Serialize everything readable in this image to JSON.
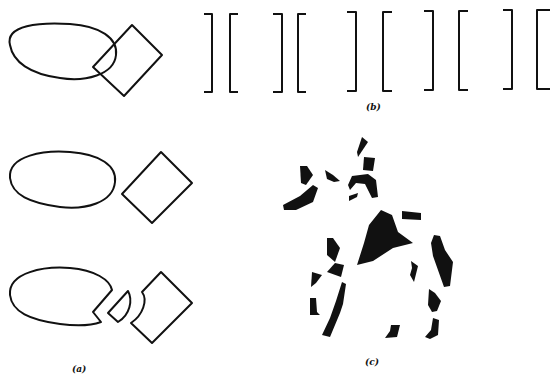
{
  "figure": {
    "panels": [
      {
        "id": "a",
        "label": "(a)",
        "description": "Ellipse and square overlapping, separated, and with occluding piece cut out"
      },
      {
        "id": "b",
        "label": "(b)",
        "description": "Row of bracket pairs ] [ ] [ ] [ ] [ ] ["
      },
      {
        "id": "c",
        "label": "(c)",
        "description": "Fragmented black silhouette of a horse and rider"
      }
    ],
    "bracket_pairs": 5,
    "colors": {
      "ink": "#111111",
      "background": "#ffffff"
    }
  }
}
